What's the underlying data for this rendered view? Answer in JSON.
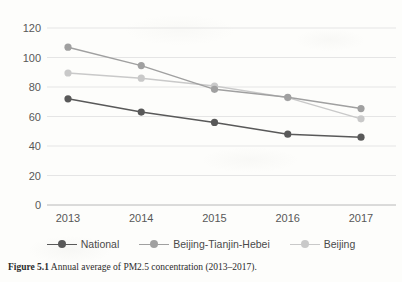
{
  "figure": {
    "caption_label": "Figure 5.1",
    "caption_text": "Annual average of PM2.5 concentration (2013–2017)."
  },
  "legend": {
    "items": [
      {
        "label": "National",
        "color": "#595959"
      },
      {
        "label": "Beijing-Tianjin-Hebei",
        "color": "#a0a0a0"
      },
      {
        "label": "Beijing",
        "color": "#c9c9c9"
      }
    ]
  },
  "axis": {
    "y_ticks": [
      "0",
      "20",
      "40",
      "60",
      "80",
      "100",
      "120"
    ],
    "x_ticks": [
      "2013",
      "2014",
      "2015",
      "2016",
      "2017"
    ]
  },
  "chart_data": {
    "type": "line",
    "title": "Annual average of PM2.5 concentration (2013–2017).",
    "xlabel": "",
    "ylabel": "",
    "categories": [
      "2013",
      "2014",
      "2015",
      "2016",
      "2017"
    ],
    "x": [
      2013,
      2014,
      2015,
      2016,
      2017
    ],
    "ylim": [
      0,
      120
    ],
    "yticks": [
      0,
      20,
      40,
      60,
      80,
      100,
      120
    ],
    "grid": "horizontal",
    "legend_position": "bottom",
    "markers": "circle",
    "series": [
      {
        "name": "National",
        "color": "#595959",
        "values": [
          72,
          63,
          56,
          48,
          46
        ]
      },
      {
        "name": "Beijing-Tianjin-Hebei",
        "color": "#a0a0a0",
        "values": [
          107,
          94.5,
          78.4,
          73,
          65.4
        ]
      },
      {
        "name": "Beijing",
        "color": "#c9c9c9",
        "values": [
          89.5,
          86,
          80.6,
          72.8,
          58.4
        ]
      }
    ]
  }
}
